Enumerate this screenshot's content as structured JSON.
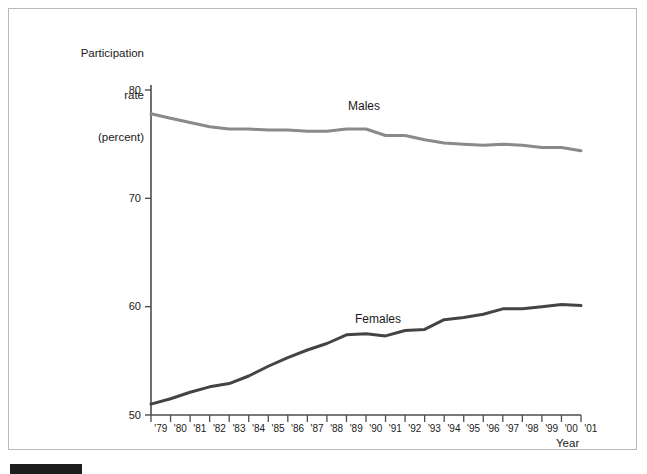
{
  "chart_data": {
    "type": "line",
    "title": "",
    "xlabel": "Year",
    "ylabel": "Participation rate (percent)",
    "ylabel_lines": [
      "Participation",
      "rate",
      "(percent)"
    ],
    "ylim": [
      50,
      80
    ],
    "y_ticks": [
      80,
      70,
      60,
      50
    ],
    "y_tick_labels": [
      "80",
      "70",
      "60",
      "50"
    ],
    "grid": false,
    "legend": "inline-labels",
    "x": [
      1979,
      1980,
      1981,
      1982,
      1983,
      1984,
      1985,
      1986,
      1987,
      1988,
      1989,
      1990,
      1991,
      1992,
      1993,
      1994,
      1995,
      1996,
      1997,
      1998,
      1999,
      2000,
      2001
    ],
    "x_tick_labels": [
      "'79",
      "'80",
      "'81",
      "'82",
      "'83",
      "'84",
      "'85",
      "'86",
      "'87",
      "'88",
      "'89",
      "'90",
      "'91",
      "'92",
      "'93",
      "'94",
      "'95",
      "'96",
      "'97",
      "'98",
      "'99",
      "'00",
      "'01"
    ],
    "series": [
      {
        "name": "Males",
        "color": "#8a8a8a",
        "values": [
          77.8,
          77.4,
          77.0,
          76.6,
          76.4,
          76.4,
          76.3,
          76.3,
          76.2,
          76.2,
          76.4,
          76.4,
          75.8,
          75.8,
          75.4,
          75.1,
          75.0,
          74.9,
          75.0,
          74.9,
          74.7,
          74.7,
          74.4
        ]
      },
      {
        "name": "Females",
        "color": "#444444",
        "values": [
          51.0,
          51.5,
          52.1,
          52.6,
          52.9,
          53.6,
          54.5,
          55.3,
          56.0,
          56.6,
          57.4,
          57.5,
          57.3,
          57.8,
          57.9,
          58.8,
          59.0,
          59.3,
          59.8,
          59.8,
          60.0,
          60.2,
          60.1
        ]
      }
    ]
  }
}
